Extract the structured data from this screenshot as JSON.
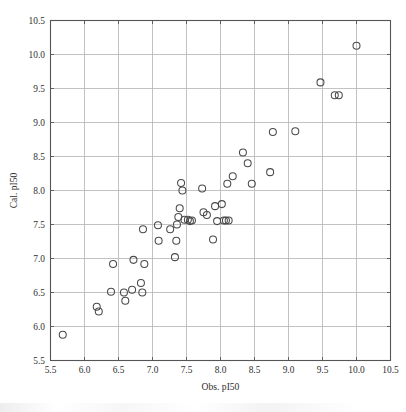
{
  "figure": {
    "background": "#ffffff",
    "marker_color": "#4a4a4a",
    "grid_color": "#b9b9b9",
    "axis_color": "#555555"
  },
  "chart_data": {
    "type": "scatter",
    "title": "",
    "xlabel": "Obs. pI50",
    "ylabel": "Cal. pI50",
    "xlim": [
      5.5,
      10.5
    ],
    "ylim": [
      5.5,
      10.5
    ],
    "xticks": [
      5.5,
      6.0,
      6.5,
      7.0,
      7.5,
      8.0,
      8.5,
      9.0,
      9.5,
      10.0,
      10.5
    ],
    "yticks": [
      5.5,
      6.0,
      6.5,
      7.0,
      7.5,
      8.0,
      8.5,
      9.0,
      9.5,
      10.0,
      10.5
    ],
    "xticklabels": [
      "5.5",
      "6.0",
      "6.5",
      "7.0",
      "7.5",
      "8.0",
      "8.5",
      "9.0",
      "9.5",
      "10.0",
      "10.5"
    ],
    "yticklabels": [
      "5.5",
      "6.0",
      "6.5",
      "7.0",
      "7.5",
      "8.0",
      "8.5",
      "9.0",
      "9.5",
      "10.0",
      "10.5"
    ],
    "grid": true,
    "legend": null,
    "marker": "open-circle",
    "marker_size": 7,
    "series": [
      {
        "name": "compounds",
        "points": [
          [
            5.68,
            5.88
          ],
          [
            6.18,
            6.29
          ],
          [
            6.21,
            6.22
          ],
          [
            6.39,
            6.51
          ],
          [
            6.42,
            6.92
          ],
          [
            6.58,
            6.5
          ],
          [
            6.6,
            6.38
          ],
          [
            6.7,
            6.54
          ],
          [
            6.72,
            6.98
          ],
          [
            6.83,
            6.64
          ],
          [
            6.85,
            6.5
          ],
          [
            6.86,
            7.43
          ],
          [
            6.88,
            6.92
          ],
          [
            7.08,
            7.49
          ],
          [
            7.09,
            7.26
          ],
          [
            7.26,
            7.43
          ],
          [
            7.33,
            7.02
          ],
          [
            7.35,
            7.26
          ],
          [
            7.36,
            7.5
          ],
          [
            7.38,
            7.61
          ],
          [
            7.4,
            7.74
          ],
          [
            7.42,
            8.11
          ],
          [
            7.44,
            8.0
          ],
          [
            7.47,
            7.57
          ],
          [
            7.52,
            7.57
          ],
          [
            7.55,
            7.55
          ],
          [
            7.58,
            7.56
          ],
          [
            7.73,
            8.03
          ],
          [
            7.75,
            7.68
          ],
          [
            7.8,
            7.64
          ],
          [
            7.89,
            7.28
          ],
          [
            7.92,
            7.77
          ],
          [
            7.95,
            7.55
          ],
          [
            8.02,
            7.8
          ],
          [
            8.05,
            7.56
          ],
          [
            8.08,
            7.56
          ],
          [
            8.1,
            8.1
          ],
          [
            8.12,
            7.56
          ],
          [
            8.18,
            8.21
          ],
          [
            8.33,
            8.56
          ],
          [
            8.4,
            8.4
          ],
          [
            8.46,
            8.1
          ],
          [
            8.73,
            8.27
          ],
          [
            8.77,
            8.86
          ],
          [
            9.1,
            8.87
          ],
          [
            9.47,
            9.59
          ],
          [
            9.68,
            9.4
          ],
          [
            9.74,
            9.4
          ],
          [
            10.0,
            10.13
          ]
        ]
      }
    ]
  }
}
